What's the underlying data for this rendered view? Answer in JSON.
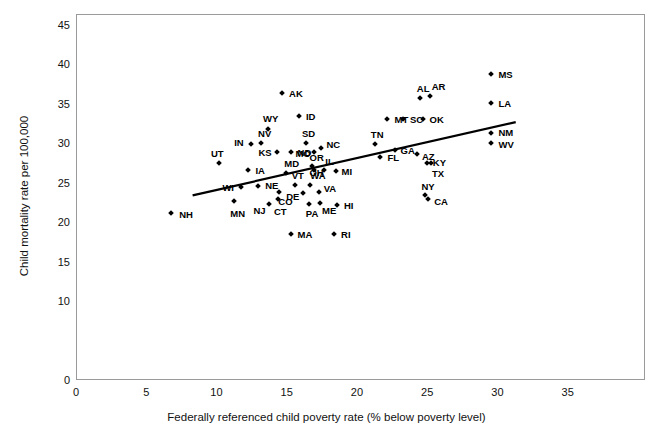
{
  "chart_data": {
    "type": "scatter",
    "title": "",
    "xlabel": "Federally referenced child poverty rate (% below poverty level)",
    "ylabel": "Child mortality rate per 100,000",
    "xlim": [
      0,
      40.5
    ],
    "ylim": [
      0,
      46.4
    ],
    "xticks": [
      0,
      5,
      10,
      15,
      20,
      25,
      30,
      35
    ],
    "yticks": [
      0,
      10,
      15,
      20,
      25,
      30,
      35,
      40,
      45
    ],
    "grid": false,
    "legend": null,
    "point_label_field": "state",
    "trendline": {
      "type": "linear",
      "x_start": 8.3,
      "y_start": 23.4,
      "x_end": 31.3,
      "y_end": 32.7
    },
    "points": [
      {
        "state": "NH",
        "x": 6.7,
        "y": 21.3,
        "lx": 8,
        "ly": 1
      },
      {
        "state": "UT",
        "x": 10.1,
        "y": 27.6,
        "lx": -8,
        "ly": -10
      },
      {
        "state": "MN",
        "x": 11.2,
        "y": 22.8,
        "lx": -4,
        "ly": 12
      },
      {
        "state": "WI",
        "x": 11.7,
        "y": 24.6,
        "lx": -19,
        "ly": 0
      },
      {
        "state": "IA",
        "x": 12.2,
        "y": 26.7,
        "lx": 7,
        "ly": 0
      },
      {
        "state": "IN",
        "x": 12.4,
        "y": 30.0,
        "lx": -17,
        "ly": -2
      },
      {
        "state": "NE",
        "x": 12.9,
        "y": 24.7,
        "lx": 7,
        "ly": -1
      },
      {
        "state": "NV",
        "x": 13.1,
        "y": 30.2,
        "lx": -3,
        "ly": -10
      },
      {
        "state": "WY",
        "x": 13.6,
        "y": 31.9,
        "lx": -5,
        "ly": -11
      },
      {
        "state": "KS",
        "x": 14.2,
        "y": 29.0,
        "lx": -18,
        "ly": 0
      },
      {
        "state": "CT",
        "x": 14.3,
        "y": 23.1,
        "lx": -4,
        "ly": 12
      },
      {
        "state": "NJ",
        "x": 13.7,
        "y": 22.5,
        "lx": -16,
        "ly": 6
      },
      {
        "state": "CO",
        "x": 14.4,
        "y": 24.0,
        "lx": -1,
        "ly": 9
      },
      {
        "state": "MD",
        "x": 14.9,
        "y": 26.4,
        "lx": -2,
        "ly": -10
      },
      {
        "state": "ND",
        "x": 15.2,
        "y": 29.0,
        "lx": 7,
        "ly": 0
      },
      {
        "state": "MA",
        "x": 15.2,
        "y": 18.6,
        "lx": 7,
        "ly": 0
      },
      {
        "state": "ID",
        "x": 15.8,
        "y": 33.6,
        "lx": 7,
        "ly": 0
      },
      {
        "state": "AK",
        "x": 14.6,
        "y": 36.5,
        "lx": 7,
        "ly": 0
      },
      {
        "state": "VT",
        "x": 15.5,
        "y": 24.9,
        "lx": -3,
        "ly": -10
      },
      {
        "state": "SD",
        "x": 16.3,
        "y": 30.2,
        "lx": -4,
        "ly": -10
      },
      {
        "state": "DE",
        "x": 16.1,
        "y": 23.8,
        "lx": -17,
        "ly": 3
      },
      {
        "state": "PA",
        "x": 16.5,
        "y": 22.4,
        "lx": -3,
        "ly": 9
      },
      {
        "state": "WA",
        "x": 16.6,
        "y": 24.9,
        "lx": 0,
        "ly": -10
      },
      {
        "state": "MO",
        "x": 16.9,
        "y": 29.0,
        "lx": -19,
        "ly": 1
      },
      {
        "state": "OR",
        "x": 16.7,
        "y": 27.3,
        "lx": -2,
        "ly": -9
      },
      {
        "state": "OH",
        "x": 16.9,
        "y": 26.7,
        "lx": -5,
        "ly": 2
      },
      {
        "state": "VA",
        "x": 17.2,
        "y": 23.9,
        "lx": 5,
        "ly": -4
      },
      {
        "state": "ME",
        "x": 17.3,
        "y": 22.6,
        "lx": 2,
        "ly": 7
      },
      {
        "state": "NC",
        "x": 17.4,
        "y": 29.6,
        "lx": 5,
        "ly": -4
      },
      {
        "state": "RI",
        "x": 18.3,
        "y": 18.6,
        "lx": 7,
        "ly": 0
      },
      {
        "state": "IL",
        "x": 17.6,
        "y": 26.8,
        "lx": 1,
        "ly": -9
      },
      {
        "state": "HI",
        "x": 18.5,
        "y": 22.3,
        "lx": 7,
        "ly": 0
      },
      {
        "state": "MI",
        "x": 18.4,
        "y": 26.6,
        "lx": 6,
        "ly": 0
      },
      {
        "state": "FL",
        "x": 21.6,
        "y": 28.4,
        "lx": 7,
        "ly": 0
      },
      {
        "state": "TN",
        "x": 21.2,
        "y": 30.0,
        "lx": -4,
        "ly": -10
      },
      {
        "state": "MT",
        "x": 22.1,
        "y": 33.2,
        "lx": 7,
        "ly": 0
      },
      {
        "state": "GA",
        "x": 22.6,
        "y": 29.3,
        "lx": 6,
        "ly": 0
      },
      {
        "state": "SC",
        "x": 23.2,
        "y": 33.2,
        "lx": 7,
        "ly": 0
      },
      {
        "state": "AZ",
        "x": 24.2,
        "y": 28.8,
        "lx": 5,
        "ly": 2
      },
      {
        "state": "OK",
        "x": 24.6,
        "y": 33.2,
        "lx": 7,
        "ly": 0
      },
      {
        "state": "AL",
        "x": 24.4,
        "y": 35.9,
        "lx": -3,
        "ly": -10
      },
      {
        "state": "AR",
        "x": 25.1,
        "y": 36.1,
        "lx": 2,
        "ly": -10
      },
      {
        "state": "KY",
        "x": 24.9,
        "y": 27.7,
        "lx": 6,
        "ly": -1
      },
      {
        "state": "TX",
        "x": 25.2,
        "y": 27.6,
        "lx": 1,
        "ly": 10
      },
      {
        "state": "NY",
        "x": 24.8,
        "y": 23.6,
        "lx": -4,
        "ly": -9
      },
      {
        "state": "CA",
        "x": 25.0,
        "y": 23.1,
        "lx": 6,
        "ly": 2
      },
      {
        "state": "MS",
        "x": 29.5,
        "y": 38.9,
        "lx": 7,
        "ly": 0
      },
      {
        "state": "LA",
        "x": 29.5,
        "y": 35.2,
        "lx": 7,
        "ly": 0
      },
      {
        "state": "NM",
        "x": 29.5,
        "y": 31.5,
        "lx": 7,
        "ly": -1
      },
      {
        "state": "WV",
        "x": 29.5,
        "y": 30.2,
        "lx": 7,
        "ly": 1
      }
    ]
  }
}
